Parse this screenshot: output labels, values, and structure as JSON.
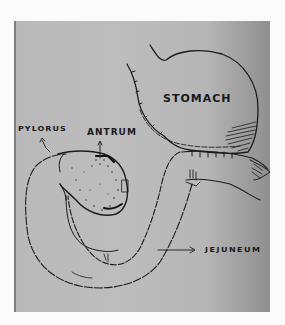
{
  "diagram": {
    "type": "hand-drawn anatomical sketch",
    "labels": {
      "stomach": "STOMACH",
      "pylorus": "PYLORUS",
      "antrum": "ANTRUM",
      "jejuneum": "JEJUNEUM"
    },
    "colors": {
      "paper": "#bbbbbb",
      "ink": "#1a1a1a",
      "background": "#fbfbfb"
    }
  }
}
